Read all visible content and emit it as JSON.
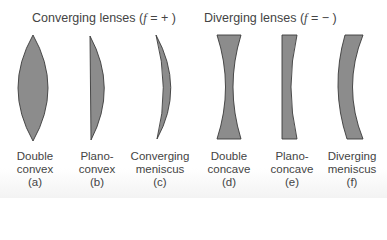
{
  "groups": {
    "converging": {
      "prefix": "Converging lenses (",
      "var": "f",
      "suffix": " =  + )"
    },
    "diverging": {
      "prefix": "Diverging lenses (",
      "var": "f",
      "suffix": " =  − )"
    }
  },
  "lenses": [
    {
      "line1": "Double",
      "line2": "convex",
      "tag": "(a)"
    },
    {
      "line1": "Plano-",
      "line2": "convex",
      "tag": "(b)"
    },
    {
      "line1": "Converging",
      "line2": "meniscus",
      "tag": "(c)"
    },
    {
      "line1": "Double",
      "line2": "concave",
      "tag": "(d)"
    },
    {
      "line1": "Plano-",
      "line2": "concave",
      "tag": "(e)"
    },
    {
      "line1": "Diverging",
      "line2": "meniscus",
      "tag": "(f)"
    }
  ],
  "colors": {
    "lens_fill": "#8c8c8c",
    "lens_stroke": "#3a3a3a",
    "text": "#444444"
  }
}
